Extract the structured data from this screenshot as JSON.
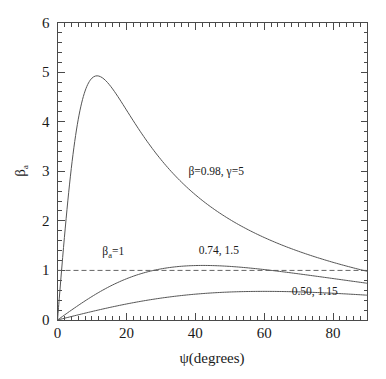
{
  "chart_data": {
    "type": "line",
    "title": "",
    "xlabel": "ψ(degrees)",
    "ylabel": "βₐ",
    "xlim": [
      0,
      90
    ],
    "ylim": [
      0,
      6
    ],
    "grid": false,
    "legend_position": "inline-annotations",
    "x_major_ticks": [
      0,
      20,
      40,
      60,
      80
    ],
    "x_major_tick_labels": [
      "0",
      "20",
      "40",
      "60",
      "80"
    ],
    "x_major_step": 20,
    "x_minor_step": 2,
    "y_major_ticks": [
      0,
      1,
      2,
      3,
      4,
      5,
      6
    ],
    "y_major_tick_labels": [
      "0",
      "1",
      "2",
      "3",
      "4",
      "5",
      "6"
    ],
    "y_major_step": 1,
    "y_minor_step": 0.2,
    "formula": "βₐ = β sinψ / (1 − β cosψ)",
    "series": [
      {
        "name": "β=0.98, γ=5",
        "beta": 0.98,
        "gamma": 5,
        "style": "solid",
        "color": "#555555",
        "peak": {
          "x": 11.5,
          "y": 4.92
        },
        "endpoint": {
          "x": 90,
          "y": 0.98
        },
        "x": [
          0,
          2,
          4,
          6,
          8,
          10,
          11.5,
          14,
          16,
          20,
          25,
          30,
          35,
          40,
          45,
          50,
          55,
          60,
          65,
          70,
          75,
          80,
          85,
          90
        ],
        "values": [
          0,
          1.68,
          2.98,
          3.86,
          4.42,
          4.77,
          4.9,
          4.86,
          4.74,
          4.33,
          3.79,
          3.3,
          2.87,
          2.51,
          2.21,
          1.95,
          1.73,
          1.55,
          1.39,
          1.26,
          1.15,
          1.07,
          1.01,
          0.98
        ]
      },
      {
        "name": "0.74, 1.5",
        "beta": 0.74,
        "gamma": 1.5,
        "style": "solid",
        "color": "#555555",
        "peak": {
          "x": 42,
          "y": 1.1
        },
        "endpoint": {
          "x": 90,
          "y": 0.74
        },
        "x": [
          0,
          5,
          10,
          15,
          20,
          25,
          27,
          30,
          35,
          40,
          45,
          50,
          55,
          60,
          65,
          70,
          75,
          80,
          85,
          90
        ],
        "values": [
          0,
          0.25,
          0.47,
          0.64,
          0.78,
          0.89,
          0.93,
          0.98,
          1.04,
          1.08,
          1.1,
          1.1,
          1.08,
          1.05,
          1.01,
          0.96,
          0.9,
          0.85,
          0.79,
          0.74
        ]
      },
      {
        "name": "0.50, 1.15",
        "beta": 0.5,
        "gamma": 1.15,
        "style": "solid",
        "color": "#555555",
        "peak": {
          "x": 60,
          "y": 0.58
        },
        "endpoint": {
          "x": 90,
          "y": 0.5
        },
        "x": [
          0,
          5,
          10,
          15,
          20,
          25,
          30,
          35,
          40,
          45,
          50,
          55,
          60,
          65,
          70,
          75,
          80,
          85,
          90
        ],
        "values": [
          0,
          0.09,
          0.17,
          0.25,
          0.32,
          0.39,
          0.45,
          0.49,
          0.53,
          0.56,
          0.57,
          0.58,
          0.58,
          0.57,
          0.56,
          0.55,
          0.53,
          0.51,
          0.5
        ]
      }
    ],
    "reference_line": {
      "label": "βₐ=1",
      "value": 1,
      "style": "dashed",
      "orientation": "horizontal",
      "color": "#666666"
    },
    "annotations": [
      {
        "id": "main-curve-label",
        "text": "β=0.98, γ=5",
        "x": 38,
        "y": 2.92
      },
      {
        "id": "ref-line-label",
        "text_main": "β",
        "text_sub": "a",
        "text_tail": "=1",
        "x": 13,
        "y": 1.32
      },
      {
        "id": "mid-curve-label",
        "text": "0.74, 1.5",
        "x": 41,
        "y": 1.33
      },
      {
        "id": "low-curve-label",
        "text": "0.50, 1.15",
        "x": 68,
        "y": 0.5
      }
    ]
  },
  "axes": {
    "y_label_main": "β",
    "y_label_sub": "a",
    "x_label": "ψ(degrees)"
  }
}
